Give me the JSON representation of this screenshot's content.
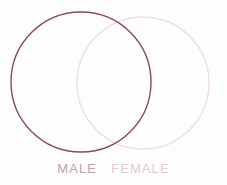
{
  "figure": {
    "type": "venn-diagram",
    "background_color": "#fdfdfd",
    "width": 227,
    "height": 185
  },
  "chart_data": {
    "type": "venn",
    "title": "",
    "subtitle": "",
    "xlabel": "",
    "ylabel": "",
    "grid": false,
    "legend_position": "bottom",
    "sets": [
      {
        "name": "MALE",
        "label": "MALE",
        "stroke_color": "#8a4a58",
        "fill_color": "none",
        "stroke_width": 1.4,
        "center_x": 81,
        "center_y": 82,
        "radius": 70
      },
      {
        "name": "FEMALE",
        "label": "FEMALE",
        "stroke_color": "#f0dde2",
        "fill_color": "none",
        "stroke_width": 1.4,
        "center_x": 143,
        "center_y": 83,
        "radius": 66
      }
    ],
    "intersection": {
      "label": "",
      "value": ""
    },
    "annotations": []
  },
  "labels": {
    "male": "MALE",
    "female": "FEMALE",
    "male_color": "#b9a3aa",
    "female_color": "#e3c9d0"
  },
  "icons": {
    "male_circle": "circle-outline-icon",
    "female_circle": "circle-outline-icon"
  }
}
